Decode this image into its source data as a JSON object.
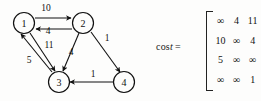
{
  "figure": {
    "kind": "directed-weighted-graph-with-cost-matrix"
  },
  "graph": {
    "nodes": [
      {
        "id": "1",
        "label": "1",
        "cx": 24,
        "cy": 23
      },
      {
        "id": "2",
        "label": "2",
        "cx": 83,
        "cy": 23
      },
      {
        "id": "3",
        "label": "3",
        "cx": 59,
        "cy": 82
      },
      {
        "id": "4",
        "label": "4",
        "cx": 124,
        "cy": 82
      }
    ],
    "edges": [
      {
        "from": "1",
        "to": "2",
        "weight": "10",
        "lx": 46,
        "ly": 8
      },
      {
        "from": "2",
        "to": "1",
        "weight": "4",
        "lx": 48,
        "ly": 31
      },
      {
        "from": "1",
        "to": "3",
        "weight": "11",
        "lx": 49,
        "ly": 45
      },
      {
        "from": "3",
        "to": "1",
        "weight": "5",
        "lx": 29,
        "ly": 60
      },
      {
        "from": "2",
        "to": "3",
        "weight": "4",
        "lx": 71,
        "ly": 52
      },
      {
        "from": "2",
        "to": "4",
        "weight": "1",
        "lx": 107,
        "ly": 38
      },
      {
        "from": "4",
        "to": "3",
        "weight": "1",
        "lx": 93,
        "ly": 74
      }
    ]
  },
  "matrix": {
    "label_prefix": "cos",
    "label_italic": "t",
    "equals": "=",
    "rows": [
      [
        "∞",
        "4",
        "11"
      ],
      [
        "10",
        "∞",
        "4"
      ],
      [
        "5",
        "∞",
        "∞"
      ],
      [
        "∞",
        "∞",
        "1"
      ]
    ]
  },
  "colors": {
    "ink": "#111111",
    "background": "#fdfdfc"
  }
}
